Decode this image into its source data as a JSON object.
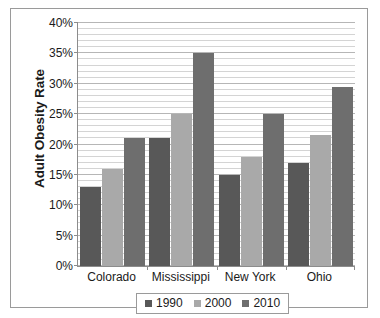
{
  "chart_data": {
    "type": "bar",
    "title": "",
    "xlabel": "",
    "ylabel": "Adult Obesity Rate",
    "categories": [
      "Colorado",
      "Mississippi",
      "New York",
      "Ohio"
    ],
    "series": [
      {
        "name": "1990",
        "color": "#585858",
        "values": [
          13,
          21,
          15,
          17
        ]
      },
      {
        "name": "2000",
        "color": "#a9a9a9",
        "values": [
          16,
          25,
          18,
          21.5
        ]
      },
      {
        "name": "2010",
        "color": "#6e6e6e",
        "values": [
          21,
          35,
          25,
          29.5
        ]
      }
    ],
    "ylim": [
      0,
      40
    ],
    "y_tick_step": 5,
    "y_tick_labels": [
      "0%",
      "5%",
      "10%",
      "15%",
      "20%",
      "25%",
      "30%",
      "35%",
      "40%"
    ],
    "y_tick_values": [
      0,
      5,
      10,
      15,
      20,
      25,
      30,
      35,
      40
    ],
    "minor_gridline_step": 1,
    "grid": true,
    "legend_position": "bottom"
  },
  "legend": {
    "entries": [
      {
        "label": "1990"
      },
      {
        "label": "2000"
      },
      {
        "label": "2010"
      }
    ]
  }
}
